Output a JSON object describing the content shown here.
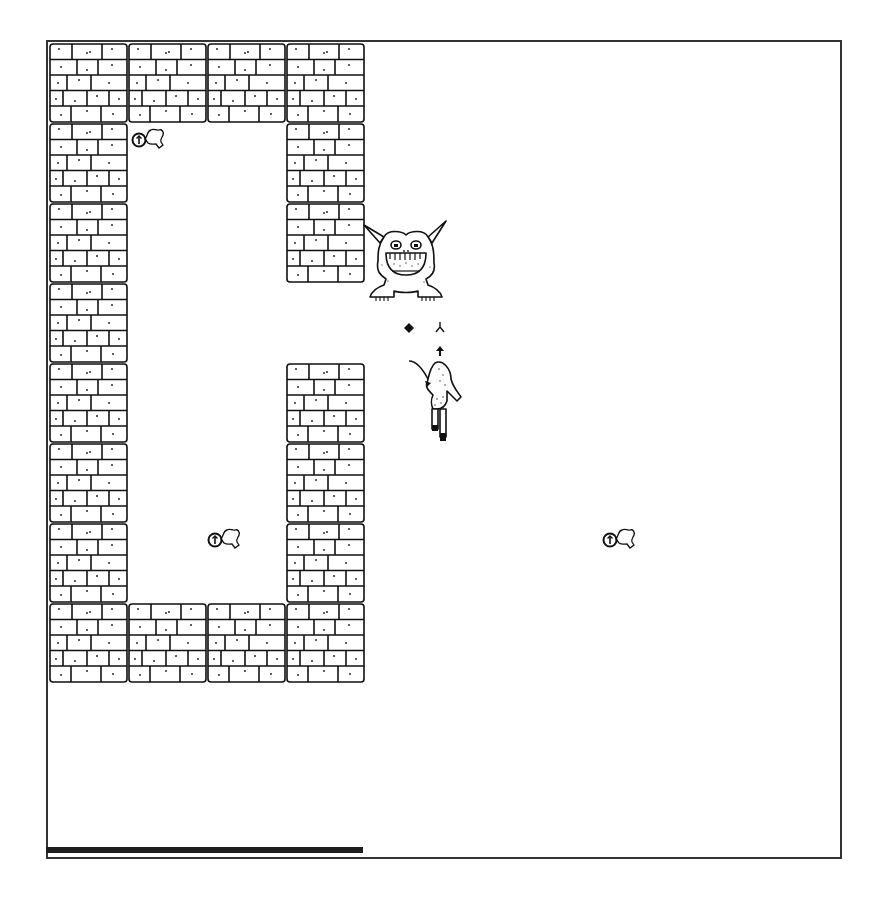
{
  "game": {
    "view": "dungeon-top-down",
    "palette": {
      "ink": "#111111",
      "background": "#ffffff",
      "frame": "#333333",
      "bar": "#1e1e1e"
    },
    "grid": {
      "origin_x": 49,
      "origin_y": 43,
      "tile_w": 79,
      "tile_h": 80
    },
    "walls": [
      [
        0,
        0
      ],
      [
        1,
        0
      ],
      [
        2,
        0
      ],
      [
        3,
        0
      ],
      [
        0,
        1
      ],
      [
        3,
        1
      ],
      [
        0,
        2
      ],
      [
        3,
        2
      ],
      [
        0,
        3
      ],
      [
        0,
        4
      ],
      [
        3,
        4
      ],
      [
        0,
        5
      ],
      [
        3,
        5
      ],
      [
        0,
        6
      ],
      [
        3,
        6
      ],
      [
        0,
        7
      ],
      [
        1,
        7
      ],
      [
        2,
        7
      ],
      [
        3,
        7
      ]
    ],
    "entities": {
      "monster": {
        "name": "horned-grinning-demon",
        "x": 362,
        "y": 215
      },
      "player": {
        "name": "archer-hero",
        "x": 405,
        "y": 355
      },
      "projectiles": [
        {
          "name": "diamond-shot",
          "x": 404,
          "y": 318
        },
        {
          "name": "arrow-fletching",
          "x": 435,
          "y": 318
        },
        {
          "name": "arrow-head",
          "x": 435,
          "y": 342
        }
      ],
      "items": [
        {
          "name": "amulet",
          "x": 130,
          "y": 125
        },
        {
          "name": "amulet",
          "x": 206,
          "y": 525
        },
        {
          "name": "amulet",
          "x": 601,
          "y": 525
        }
      ]
    },
    "status": {
      "health_percent": 40
    }
  }
}
